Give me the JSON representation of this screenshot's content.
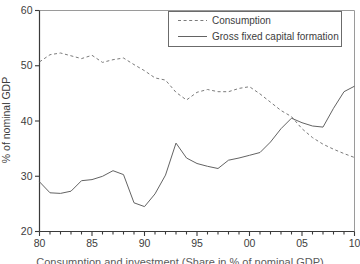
{
  "figure": {
    "caption": "Consumption and investment (Share in % of nominal GDP)"
  },
  "chart_data": {
    "type": "line",
    "title": "",
    "xlabel": "",
    "ylabel": "% of nominal GDP",
    "x_start": 1980,
    "x_end": 2010,
    "ylim": [
      20,
      60
    ],
    "grid": false,
    "legend_position": "top-right",
    "yticks": [
      60,
      50,
      40,
      30,
      20
    ],
    "ytick_labels": [
      "60",
      "50",
      "40",
      "30",
      "20"
    ],
    "xticks_major": [
      1980,
      1985,
      1990,
      1995,
      2000,
      2005,
      2010
    ],
    "xtick_labels": [
      "80",
      "85",
      "90",
      "95",
      "00",
      "05",
      "10"
    ],
    "years": [
      1980,
      1981,
      1982,
      1983,
      1984,
      1985,
      1986,
      1987,
      1988,
      1989,
      1990,
      1991,
      1992,
      1993,
      1994,
      1995,
      1996,
      1997,
      1998,
      1999,
      2000,
      2001,
      2002,
      2003,
      2004,
      2005,
      2006,
      2007,
      2008,
      2009,
      2010
    ],
    "series": [
      {
        "id": "consumption",
        "name": "Consumption",
        "style": "dashed",
        "color": "#7b7b7b",
        "values": [
          50.7,
          52.0,
          52.3,
          51.8,
          51.3,
          51.9,
          50.6,
          51.1,
          51.4,
          50.2,
          49.1,
          47.8,
          47.4,
          45.2,
          43.8,
          45.2,
          45.7,
          45.3,
          45.3,
          45.9,
          46.2,
          44.9,
          43.4,
          41.9,
          40.8,
          38.6,
          37.0,
          35.8,
          34.9,
          34.1,
          33.4
        ]
      },
      {
        "id": "gfcf",
        "name": "Gross fixed capital formation",
        "style": "solid",
        "color": "#636363",
        "values": [
          29.0,
          27.0,
          26.9,
          27.3,
          29.2,
          29.4,
          30.0,
          31.0,
          30.3,
          25.2,
          24.5,
          26.8,
          30.2,
          36.0,
          33.3,
          32.3,
          31.8,
          31.4,
          32.9,
          33.3,
          33.8,
          34.3,
          36.2,
          38.6,
          40.5,
          39.7,
          39.1,
          38.9,
          42.3,
          45.3,
          46.3
        ]
      }
    ],
    "colors": {
      "axis": "#3a3a3a",
      "frame": "#9a9a9a",
      "legend_border": "#6b6b6b",
      "text": "#3d3d3d",
      "background": "#ffffff"
    }
  }
}
